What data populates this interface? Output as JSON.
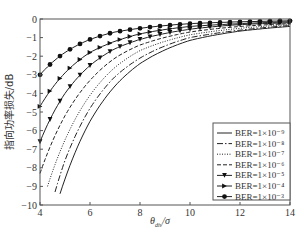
{
  "chart_data": {
    "type": "line",
    "title": "",
    "xlabel": "θ_div/σ",
    "xlabel_main": "θ",
    "xlabel_sub": "div",
    "xlabel_tail": "/σ",
    "ylabel": "指向功率损失/dB",
    "xlim": [
      4,
      14
    ],
    "ylim": [
      -10,
      0
    ],
    "xticks": [
      4,
      6,
      8,
      10,
      12,
      14
    ],
    "yticks": [
      0,
      -1,
      -2,
      -3,
      -4,
      -5,
      -6,
      -7,
      -8,
      -9,
      -10
    ],
    "grid": false,
    "legend_position": "lower right",
    "series": [
      {
        "name": "BER=1×10⁻⁹",
        "style": "solid",
        "marker": "none",
        "x": [
          4.8,
          5,
          6,
          7,
          8,
          10,
          12,
          14
        ],
        "y": [
          -9.4,
          -8.6,
          -5.5,
          -3.6,
          -2.4,
          -1.15,
          -0.65,
          -0.4
        ]
      },
      {
        "name": "BER=1×10⁻⁸",
        "style": "dashdot",
        "marker": "none",
        "x": [
          4.6,
          5,
          6,
          7,
          8,
          10,
          12,
          14
        ],
        "y": [
          -9.3,
          -7.6,
          -4.8,
          -3.1,
          -2.1,
          -1.0,
          -0.6,
          -0.35
        ]
      },
      {
        "name": "BER=1×10⁻⁷",
        "style": "dotted",
        "marker": "none",
        "x": [
          4.3,
          5,
          6,
          7,
          8,
          10,
          12,
          14
        ],
        "y": [
          -9.0,
          -6.5,
          -4.1,
          -2.6,
          -1.7,
          -0.85,
          -0.5,
          -0.3
        ]
      },
      {
        "name": "BER=1×10⁻⁶",
        "style": "dashed",
        "marker": "none",
        "x": [
          4,
          5,
          6,
          7,
          8,
          10,
          12,
          14
        ],
        "y": [
          -8.3,
          -5.2,
          -3.3,
          -2.1,
          -1.4,
          -0.7,
          -0.4,
          -0.25
        ]
      },
      {
        "name": "BER=1×10⁻⁵",
        "style": "solid",
        "marker": "triangle-down",
        "x": [
          4,
          5,
          6,
          7,
          8,
          10,
          12,
          14
        ],
        "y": [
          -6.6,
          -4.0,
          -2.5,
          -1.6,
          -1.1,
          -0.55,
          -0.3,
          -0.2
        ]
      },
      {
        "name": "BER=1×10⁻⁴",
        "style": "solid",
        "marker": "triangle-right",
        "x": [
          4,
          5,
          6,
          7,
          8,
          10,
          12,
          14
        ],
        "y": [
          -4.7,
          -2.9,
          -1.8,
          -1.2,
          -0.8,
          -0.4,
          -0.25,
          -0.15
        ]
      },
      {
        "name": "BER=1×10⁻³",
        "style": "solid",
        "marker": "circle",
        "x": [
          4,
          5,
          6,
          7,
          8,
          10,
          12,
          14
        ],
        "y": [
          -3.0,
          -1.8,
          -1.1,
          -0.7,
          -0.5,
          -0.25,
          -0.15,
          -0.1
        ]
      }
    ]
  }
}
